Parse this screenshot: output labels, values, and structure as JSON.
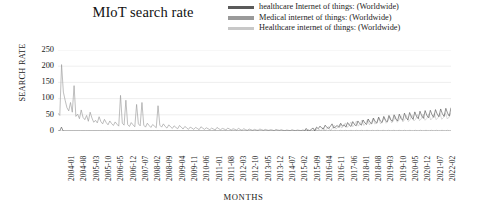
{
  "chart_data": {
    "type": "line",
    "title": "MIoT search rate",
    "xlabel": "MONTHS",
    "ylabel": "SEARCH RATE",
    "ylim": [
      0,
      250
    ],
    "yticks": [
      0,
      50,
      100,
      150,
      200,
      250
    ],
    "grid": true,
    "legend_position": "top-right",
    "xticks": [
      "2004-01",
      "2004-08",
      "2005-03",
      "2005-10",
      "2006-05",
      "2006-12",
      "2007-07",
      "2008-02",
      "2008-09",
      "2009-04",
      "2009-11",
      "2010-06",
      "2011-01",
      "2011-08",
      "2012-03",
      "2012-10",
      "2013-05",
      "2013-12",
      "2014-07",
      "2015-02",
      "2015-09",
      "2016-04",
      "2016-11",
      "2017-06",
      "2018-01",
      "2018-08",
      "2019-03",
      "2019-10",
      "2020-05",
      "2020-12",
      "2021-07",
      "2022-02"
    ],
    "x_start": "2004-01",
    "x_end": "2022-06",
    "series": [
      {
        "name": "healthcare Internet of things: (Worldwide)",
        "color": "#5a5a5a",
        "values": [
          0,
          0,
          12,
          0,
          0,
          0,
          0,
          0,
          0,
          0,
          0,
          0,
          0,
          0,
          0,
          0,
          0,
          0,
          0,
          0,
          0,
          0,
          0,
          0,
          0,
          0,
          0,
          0,
          0,
          0,
          0,
          0,
          0,
          0,
          0,
          0,
          0,
          0,
          0,
          0,
          0,
          0,
          0,
          0,
          0,
          0,
          0,
          0,
          0,
          0,
          0,
          0,
          0,
          0,
          0,
          0,
          0,
          0,
          0,
          0,
          0,
          0,
          0,
          0,
          0,
          0,
          0,
          0,
          0,
          0,
          0,
          0,
          0,
          0,
          0,
          0,
          0,
          0,
          0,
          0,
          0,
          0,
          0,
          0,
          0,
          0,
          0,
          0,
          0,
          0,
          0,
          0,
          0,
          0,
          0,
          0,
          0,
          0,
          0,
          0,
          0,
          0,
          0,
          0,
          0,
          0,
          0,
          0,
          0,
          0,
          0,
          0,
          0,
          0,
          0,
          0,
          0,
          0,
          0,
          0,
          0,
          0,
          0,
          0,
          0,
          0,
          0,
          0,
          0,
          0,
          0,
          0,
          0,
          0,
          0,
          0,
          0,
          0,
          0,
          0,
          0,
          0,
          0,
          0,
          8,
          0,
          0,
          6,
          9,
          0,
          12,
          7,
          15,
          9,
          6,
          18,
          11,
          8,
          14,
          22,
          9,
          13,
          17,
          11,
          24,
          15,
          19,
          12,
          26,
          18,
          14,
          29,
          20,
          16,
          31,
          23,
          18,
          34,
          25,
          20,
          37,
          27,
          22,
          40,
          29,
          24,
          43,
          31,
          26,
          45,
          33,
          28,
          48,
          35,
          30,
          50,
          37,
          31,
          52,
          39,
          33,
          55,
          41,
          34,
          57,
          43,
          36,
          59,
          45,
          38,
          61,
          47,
          39,
          63,
          48,
          41,
          64,
          50,
          42,
          66,
          52,
          44,
          68,
          53,
          45,
          70,
          55,
          46,
          72
        ]
      },
      {
        "name": "Medical internet of things: (Worldwide)",
        "color": "#9a9a9a",
        "values": [
          55,
          48,
          205,
          120,
          95,
          72,
          62,
          88,
          58,
          140,
          45,
          52,
          38,
          65,
          42,
          35,
          48,
          30,
          58,
          40,
          27,
          33,
          25,
          44,
          29,
          22,
          36,
          26,
          19,
          31,
          23,
          17,
          28,
          21,
          15,
          110,
          24,
          18,
          95,
          20,
          14,
          26,
          19,
          13,
          82,
          22,
          16,
          88,
          18,
          12,
          24,
          17,
          11,
          20,
          15,
          10,
          78,
          18,
          12,
          22,
          14,
          9,
          19,
          13,
          8,
          16,
          11,
          7,
          17,
          12,
          6,
          14,
          10,
          5,
          12,
          9,
          5,
          11,
          8,
          4,
          13,
          9,
          5,
          10,
          7,
          4,
          9,
          6,
          3,
          11,
          7,
          4,
          8,
          6,
          3,
          9,
          6,
          3,
          7,
          5,
          3,
          8,
          5,
          2,
          7,
          4,
          2,
          6,
          4,
          2,
          5,
          3,
          2,
          6,
          4,
          2,
          5,
          3,
          2,
          4,
          3,
          1,
          5,
          3,
          2,
          4,
          2,
          1,
          3,
          2,
          1,
          4,
          2,
          1,
          3,
          2,
          1,
          3,
          2,
          1,
          2,
          1,
          1,
          2,
          1,
          1,
          2,
          1,
          1,
          2,
          1,
          1,
          2,
          1,
          1,
          2,
          1,
          1,
          2,
          1,
          1,
          2,
          1,
          1,
          2,
          1,
          1,
          2,
          1,
          1,
          2,
          1,
          1,
          2,
          1,
          1,
          2,
          1,
          1,
          2,
          1,
          1,
          2,
          1,
          1,
          2,
          1,
          1,
          2,
          1,
          1,
          2,
          1,
          1,
          2,
          1,
          1,
          2,
          1,
          1,
          2,
          1,
          1,
          2,
          1,
          1,
          2,
          1,
          1,
          2,
          1,
          1,
          2,
          1,
          1,
          2,
          1,
          1,
          2,
          1,
          1
        ]
      },
      {
        "name": "Healthcare internet of things: (Worldwide)",
        "color": "#c8c8c8",
        "values": [
          0,
          0,
          0,
          0,
          0,
          0,
          0,
          0,
          0,
          0,
          0,
          0,
          0,
          0,
          0,
          0,
          0,
          0,
          0,
          0,
          0,
          0,
          0,
          0,
          0,
          0,
          0,
          0,
          0,
          0,
          0,
          0,
          0,
          0,
          0,
          0,
          0,
          0,
          0,
          0,
          0,
          0,
          0,
          0,
          0,
          0,
          0,
          0,
          0,
          0,
          0,
          0,
          0,
          0,
          0,
          0,
          0,
          0,
          0,
          0,
          0,
          0,
          0,
          0,
          0,
          0,
          0,
          0,
          0,
          0,
          0,
          0,
          0,
          0,
          0,
          0,
          0,
          0,
          0,
          0,
          0,
          0,
          0,
          0,
          0,
          0,
          0,
          0,
          0,
          0,
          0,
          0,
          0,
          0,
          0,
          0,
          0,
          0,
          0,
          0,
          0,
          0,
          0,
          0,
          0,
          0,
          0,
          0,
          0,
          0,
          0,
          0,
          0,
          0,
          0,
          0,
          0,
          0,
          0,
          0,
          0,
          0,
          0,
          0,
          0,
          0,
          0,
          0,
          0,
          0,
          0,
          0,
          0,
          0,
          0,
          6,
          0,
          0,
          0,
          9,
          0,
          5,
          0,
          11,
          0,
          7,
          14,
          0,
          9,
          18,
          6,
          12,
          21,
          9,
          15,
          25,
          11,
          17,
          28,
          13,
          20,
          31,
          15,
          22,
          34,
          17,
          24,
          36,
          19,
          26,
          38,
          21,
          28,
          40,
          22,
          29,
          42,
          24,
          31,
          44,
          25,
          32,
          45,
          27,
          34,
          47,
          28,
          35,
          48,
          29,
          36,
          50,
          31,
          37,
          51,
          32,
          38,
          52,
          33,
          39,
          53,
          34,
          40,
          54,
          35,
          41,
          55,
          36,
          42,
          56,
          37,
          43,
          57
        ]
      }
    ]
  }
}
